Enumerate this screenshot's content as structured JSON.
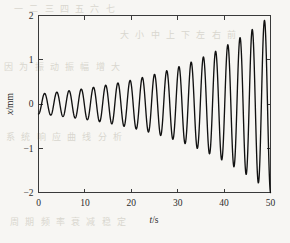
{
  "figure": {
    "background_color": "#f7f6f3",
    "curve_color": "#111111",
    "axis_color": "#3a3a3a",
    "bleed_through_color": "#d9d6cf"
  },
  "bleed_text": {
    "line1": "一 二 三 四 五 六 七",
    "line2": "大 小 中 上 下 左 右 前",
    "line3": "因 为 振 动 振 幅 增 大",
    "line4": "系 统 响 应 曲 线 分 析",
    "line5": "周 期 频 率 衰 减 稳 定"
  },
  "chart_data": {
    "type": "line",
    "title": "",
    "subtitle": "",
    "xlabel": "t/s",
    "xlabel_italic_part": "t",
    "xlabel_rest": "/s",
    "ylabel": "x/mm",
    "ylabel_italic_part": "x",
    "ylabel_rest": "/mm",
    "xlim": [
      0,
      50
    ],
    "ylim": [
      -2,
      2
    ],
    "xticks": [
      0,
      10,
      20,
      30,
      40,
      50
    ],
    "xticklabels": [
      "0",
      "10",
      "20",
      "30",
      "40",
      "50"
    ],
    "yticks": [
      -2,
      -1,
      0,
      1,
      2
    ],
    "yticklabels": [
      "−2",
      "−1",
      "0",
      "1",
      "2"
    ],
    "grid": false,
    "legend": null,
    "tick_direction": "in",
    "frame": "box",
    "series": [
      {
        "name": "x(t)",
        "description": "exponentially growing sinusoidal oscillation (unstable / self-excited vibration)",
        "color": "#111111",
        "linewidth": 1.35,
        "model": {
          "form": "x(t) = -A0 * exp(g*t) * cos(2*pi*t/T + phi)",
          "A0": 0.225,
          "growth_rate_g": 0.0437,
          "period_T": 2.632,
          "phase_phi": 0.0,
          "t_start": 0,
          "t_end": 50,
          "samples": 1200
        },
        "envelope_amplitude_at": {
          "t0": 0.23,
          "t10": 0.35,
          "t20": 0.54,
          "t30": 0.84,
          "t40": 1.29,
          "t50": 2.0
        },
        "x": [
          0,
          1.3,
          2.6,
          3.9,
          5.3,
          6.6,
          7.9,
          9.2,
          10.5,
          11.8,
          13.2,
          14.5,
          15.8,
          17.1,
          18.4,
          19.7,
          21.1,
          22.4,
          23.7,
          25.0,
          26.3,
          27.6,
          28.9,
          30.3,
          31.6,
          32.9,
          34.2,
          35.5,
          36.8,
          38.2,
          39.5,
          40.8,
          42.1,
          43.4,
          44.7,
          46.1,
          47.4,
          48.7,
          50.0
        ],
        "y": [
          -0.23,
          0.24,
          -0.25,
          0.27,
          -0.28,
          0.3,
          -0.32,
          0.34,
          -0.36,
          0.38,
          -0.4,
          0.43,
          -0.45,
          0.48,
          -0.51,
          0.54,
          -0.58,
          0.61,
          -0.65,
          0.69,
          -0.73,
          0.78,
          -0.82,
          0.87,
          -0.93,
          0.98,
          -1.04,
          1.11,
          -1.17,
          1.25,
          -1.32,
          1.4,
          -1.49,
          1.58,
          -1.68,
          1.78,
          -1.89,
          2.0,
          2.0
        ]
      }
    ]
  }
}
